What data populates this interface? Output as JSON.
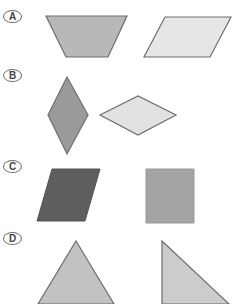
{
  "options": [
    {
      "label": "A",
      "label_top": 10,
      "shapes": [
        {
          "name": "trapezoid",
          "fill": "#b8b8b8",
          "stroke": "#6e6e6e",
          "points": "46,16 127,16 108,57 66,57"
        },
        {
          "name": "parallelogram",
          "fill": "#e6e6e6",
          "stroke": "#6e6e6e",
          "points": "165,17 231,17 210,57 144,57"
        }
      ]
    },
    {
      "label": "B",
      "label_top": 69,
      "shapes": [
        {
          "name": "rhombus-vertical",
          "fill": "#9a9a9a",
          "stroke": "#707070",
          "points": "67,77 88,115 67,154 48,115"
        },
        {
          "name": "rhombus-horizontal",
          "fill": "#e2e2e2",
          "stroke": "#6e6e6e",
          "points": "100,115 138,96 176,115 138,135"
        }
      ]
    },
    {
      "label": "C",
      "label_top": 160,
      "shapes": [
        {
          "name": "parallelogram-dark",
          "fill": "#5e5e5e",
          "stroke": "#555555",
          "points": "52,169 100,169 85,221 37,221"
        },
        {
          "name": "rectangle",
          "fill": "#a4a4a4",
          "stroke": "#9a9a9a",
          "points": "146,169 194,169 194,223 146,223"
        }
      ]
    },
    {
      "label": "D",
      "label_top": 232,
      "shapes": [
        {
          "name": "isosceles-triangle",
          "fill": "#c2c2c2",
          "stroke": "#6e6e6e",
          "points": "76,241 114,304 38,304"
        },
        {
          "name": "right-triangle",
          "fill": "#cccccc",
          "stroke": "#6e6e6e",
          "points": "162,241 229,304 162,304"
        }
      ]
    }
  ]
}
